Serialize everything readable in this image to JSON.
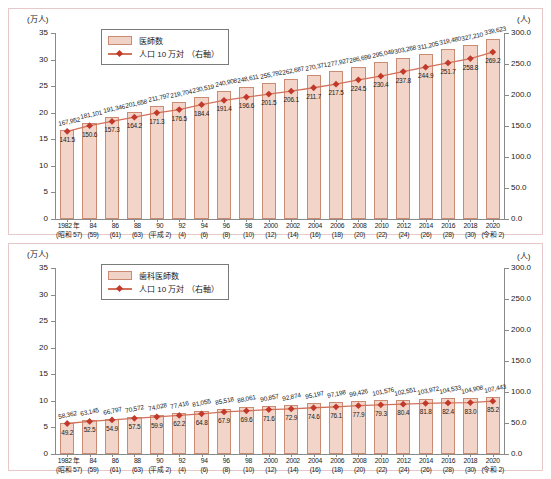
{
  "chart_data": [
    {
      "type": "bar",
      "id": "physicians",
      "title": "",
      "ylabel_left": "(万人)",
      "ylabel_right": "(人)",
      "legend": [
        {
          "label": "医師数",
          "marker": "bar-swatch"
        },
        {
          "label": "人口 10 万対 （右軸）",
          "marker": "line-diamond"
        }
      ],
      "legend_position": "top-left-inside",
      "grid": false,
      "ylim_left": [
        0,
        35
      ],
      "yticks_left": [
        "0",
        "5",
        "10",
        "15",
        "20",
        "25",
        "30",
        "35"
      ],
      "ylim_right": [
        0,
        300
      ],
      "yticks_right": [
        "0.0",
        "50.0",
        "100.0",
        "150.0",
        "200.0",
        "250.0",
        "300.0"
      ],
      "categories": [
        {
          "year": "1982 年",
          "era": "(昭和 57)"
        },
        {
          "year": "84",
          "era": "(59)"
        },
        {
          "year": "86",
          "era": "(61)"
        },
        {
          "year": "88",
          "era": "(63)"
        },
        {
          "year": "90",
          "era": "(平成 2)"
        },
        {
          "year": "92",
          "era": "(4)"
        },
        {
          "year": "94",
          "era": "(6)"
        },
        {
          "year": "96",
          "era": "(8)"
        },
        {
          "year": "98",
          "era": "(10)"
        },
        {
          "year": "2000",
          "era": "(12)"
        },
        {
          "year": "2002",
          "era": "(14)"
        },
        {
          "year": "2004",
          "era": "(16)"
        },
        {
          "year": "2006",
          "era": "(18)"
        },
        {
          "year": "2008",
          "era": "(20)"
        },
        {
          "year": "2010",
          "era": "(22)"
        },
        {
          "year": "2012",
          "era": "(24)"
        },
        {
          "year": "2014",
          "era": "(26)"
        },
        {
          "year": "2016",
          "era": "(28)"
        },
        {
          "year": "2018",
          "era": "(30)"
        },
        {
          "year": "2020",
          "era": "(令和 2)"
        }
      ],
      "series": [
        {
          "name": "医師数",
          "axis": "left",
          "unit": "人",
          "labels": [
            "167,952",
            "181,101",
            "191,346",
            "201,658",
            "211,797",
            "219,704",
            "230,519",
            "240,908",
            "248,611",
            "255,792",
            "262,687",
            "270,371",
            "277,927",
            "286,699",
            "295,049",
            "303,268",
            "311,205",
            "319,480",
            "327,210",
            "339,623"
          ],
          "values": [
            16.7952,
            18.1101,
            19.1346,
            20.1658,
            21.1797,
            21.9704,
            23.0519,
            24.0908,
            24.8611,
            25.5792,
            26.2687,
            27.0371,
            27.7927,
            28.6699,
            29.5049,
            30.3268,
            31.1205,
            31.948,
            32.721,
            33.9623
          ]
        },
        {
          "name": "人口 10 万対",
          "axis": "right",
          "labels": [
            "141.5",
            "150.6",
            "157.3",
            "164.2",
            "171.3",
            "176.5",
            "184.4",
            "191.4",
            "196.6",
            "201.5",
            "206.1",
            "211.7",
            "217.5",
            "224.5",
            "230.4",
            "237.8",
            "244.9",
            "251.7",
            "258.8",
            "269.2"
          ],
          "values": [
            141.5,
            150.6,
            157.3,
            164.2,
            171.3,
            176.5,
            184.4,
            191.4,
            196.6,
            201.5,
            206.1,
            211.7,
            217.5,
            224.5,
            230.4,
            237.8,
            244.9,
            251.7,
            258.8,
            269.2
          ]
        }
      ]
    },
    {
      "type": "bar",
      "id": "dentists",
      "title": "",
      "ylabel_left": "(万人)",
      "ylabel_right": "(人)",
      "legend": [
        {
          "label": "歯科医師数",
          "marker": "bar-swatch"
        },
        {
          "label": "人口 10 万対 （右軸）",
          "marker": "line-diamond"
        }
      ],
      "legend_position": "top-left-inside",
      "grid": false,
      "ylim_left": [
        0,
        35
      ],
      "yticks_left": [
        "0",
        "5",
        "10",
        "15",
        "20",
        "25",
        "30",
        "35"
      ],
      "ylim_right": [
        0,
        300
      ],
      "yticks_right": [
        "0.0",
        "50.0",
        "100.0",
        "150.0",
        "200.0",
        "250.0",
        "300.0"
      ],
      "categories": [
        {
          "year": "1982 年",
          "era": "(昭和 57)"
        },
        {
          "year": "84",
          "era": "(59)"
        },
        {
          "year": "86",
          "era": "(61)"
        },
        {
          "year": "88",
          "era": "(63)"
        },
        {
          "year": "90",
          "era": "(平成 2)"
        },
        {
          "year": "92",
          "era": "(4)"
        },
        {
          "year": "94",
          "era": "(6)"
        },
        {
          "year": "96",
          "era": "(8)"
        },
        {
          "year": "98",
          "era": "(10)"
        },
        {
          "year": "2000",
          "era": "(12)"
        },
        {
          "year": "2002",
          "era": "(14)"
        },
        {
          "year": "2004",
          "era": "(16)"
        },
        {
          "year": "2006",
          "era": "(18)"
        },
        {
          "year": "2008",
          "era": "(20)"
        },
        {
          "year": "2010",
          "era": "(22)"
        },
        {
          "year": "2012",
          "era": "(24)"
        },
        {
          "year": "2014",
          "era": "(26)"
        },
        {
          "year": "2016",
          "era": "(28)"
        },
        {
          "year": "2018",
          "era": "(30)"
        },
        {
          "year": "2020",
          "era": "(令和 2)"
        }
      ],
      "series": [
        {
          "name": "歯科医師数",
          "axis": "left",
          "unit": "人",
          "labels": [
            "58,362",
            "63,145",
            "66,797",
            "70,572",
            "74,028",
            "77,416",
            "81,055",
            "85,518",
            "88,061",
            "90,857",
            "92,874",
            "95,197",
            "97,198",
            "99,426",
            "101,576",
            "102,551",
            "103,972",
            "104,533",
            "104,908",
            "107,443"
          ],
          "values": [
            5.8362,
            6.3145,
            6.6797,
            7.0572,
            7.4028,
            7.7416,
            8.1055,
            8.5518,
            8.8061,
            9.0857,
            9.2874,
            9.5197,
            9.7198,
            9.9426,
            10.1576,
            10.2551,
            10.3972,
            10.4533,
            10.4908,
            10.7443
          ]
        },
        {
          "name": "人口 10 万対",
          "axis": "right",
          "labels": [
            "49.2",
            "52.5",
            "54.9",
            "57.5",
            "59.9",
            "62.2",
            "64.8",
            "67.9",
            "69.6",
            "71.6",
            "72.9",
            "74.6",
            "76.1",
            "77.9",
            "79.3",
            "80.4",
            "81.8",
            "82.4",
            "83.0",
            "85.2"
          ],
          "values": [
            49.2,
            52.5,
            54.9,
            57.5,
            59.9,
            62.2,
            64.8,
            67.9,
            69.6,
            71.6,
            72.9,
            74.6,
            76.1,
            77.9,
            79.3,
            80.4,
            81.8,
            82.4,
            83.0,
            85.2
          ]
        }
      ]
    }
  ],
  "colors": {
    "bar_fill": "#f2d5c8",
    "bar_stroke": "#c98b72",
    "line": "#d2715a",
    "marker": "#c0392b",
    "axis": "#8a8a8a",
    "panel_border": "#e8c9c9",
    "text": "#1a1a1a"
  }
}
